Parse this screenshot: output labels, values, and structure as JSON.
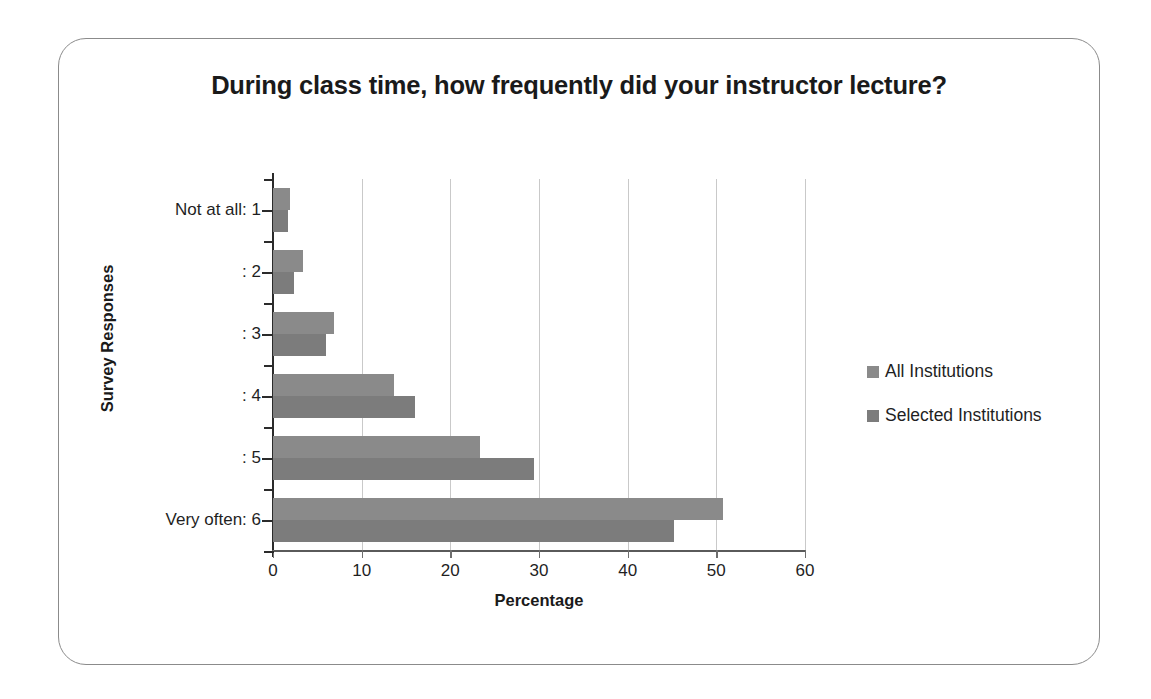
{
  "chart_data": {
    "type": "bar",
    "orientation": "horizontal",
    "title": "During class time, how frequently did your instructor lecture?",
    "xlabel": "Percentage",
    "ylabel": "Survey Responses",
    "categories": [
      "Not at all: 1",
      ": 2",
      ": 3",
      ": 4",
      ": 5",
      "Very often: 6"
    ],
    "series": [
      {
        "name": "All Institutions",
        "color": "#8a8a8a",
        "values": [
          1.9,
          3.4,
          6.9,
          13.6,
          23.3,
          50.8
        ]
      },
      {
        "name": "Selected Institutions",
        "color": "#7c7c7c",
        "values": [
          1.7,
          2.4,
          6.0,
          16.0,
          29.4,
          45.2
        ]
      }
    ],
    "xlim": [
      0,
      60
    ],
    "xticks": [
      0,
      10,
      20,
      30,
      40,
      50,
      60
    ],
    "xticklabels": [
      "0",
      "10",
      "20",
      "30",
      "40",
      "50",
      "60"
    ],
    "grid": "vertical",
    "legend_position": "right"
  },
  "frame": {
    "border_color": "#8b8b8b",
    "background": "#ffffff"
  }
}
